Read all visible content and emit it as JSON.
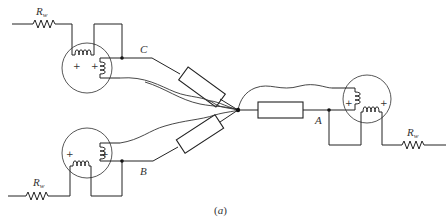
{
  "figure": {
    "caption_open": "(",
    "caption_letter": "a",
    "caption_close": ")",
    "line_color": "#222222",
    "background": "#ffffff"
  },
  "nodes": {
    "A": {
      "label": "A"
    },
    "B": {
      "label": "B"
    },
    "C": {
      "label": "C"
    }
  },
  "winding_resistors": [
    {
      "id": "rw-top-left",
      "label_main": "R",
      "label_sub": "w"
    },
    {
      "id": "rw-bottom-left",
      "label_main": "R",
      "label_sub": "w"
    },
    {
      "id": "rw-right",
      "label_main": "R",
      "label_sub": "w"
    }
  ],
  "transformers": [
    {
      "id": "xfmr-top-left",
      "polarity_marks": [
        "+",
        "+"
      ]
    },
    {
      "id": "xfmr-bottom-left",
      "polarity_marks": [
        "+",
        "+"
      ]
    },
    {
      "id": "xfmr-right",
      "polarity_marks": [
        "+",
        "+"
      ]
    }
  ],
  "load_resistors": [
    {
      "id": "load-c"
    },
    {
      "id": "load-b"
    },
    {
      "id": "load-a"
    }
  ],
  "junction": {
    "id": "neutral-point"
  }
}
